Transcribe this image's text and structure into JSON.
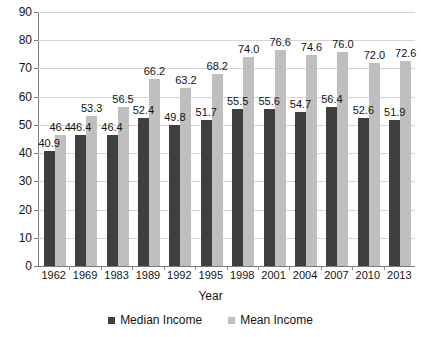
{
  "chart_data": {
    "type": "bar",
    "title": "",
    "subtitle": "",
    "xlabel": "Year",
    "ylabel": "",
    "ylim": [
      0,
      90
    ],
    "yticks": [
      0,
      10,
      20,
      30,
      40,
      50,
      60,
      70,
      80,
      90
    ],
    "grid": true,
    "legend_position": "bottom",
    "categories": [
      "1962",
      "1969",
      "1983",
      "1989",
      "1992",
      "1995",
      "1998",
      "2001",
      "2004",
      "2007",
      "2010",
      "2013"
    ],
    "series": [
      {
        "name": "Median Income",
        "color": "#3f3f3f",
        "values": [
          40.9,
          46.4,
          46.4,
          52.4,
          49.8,
          51.7,
          55.5,
          55.6,
          54.7,
          56.4,
          52.6,
          51.9
        ]
      },
      {
        "name": "Mean Income",
        "color": "#bfbfbf",
        "values": [
          46.4,
          53.3,
          56.5,
          66.2,
          63.2,
          68.2,
          74.0,
          76.6,
          74.6,
          76.0,
          72.0,
          72.6
        ]
      }
    ],
    "data_labels": {
      "median": [
        "40.9",
        "46.4",
        "46.4",
        "52.4",
        "49.8",
        "51.7",
        "55.5",
        "55.6",
        "54.7",
        "56.4",
        "52.6",
        "51.9"
      ],
      "mean": [
        "46.4",
        "53.3",
        "56.5",
        "66.2",
        "63.2",
        "68.2",
        "74.0",
        "76.6",
        "74.6",
        "76.0",
        "72.0",
        "72.6"
      ]
    }
  },
  "axis": {
    "y_tick_labels": [
      "90",
      "80",
      "70",
      "60",
      "50",
      "40",
      "30",
      "20",
      "10",
      "0"
    ],
    "x_title": "Year"
  },
  "legend": {
    "items": [
      {
        "label": "Median Income"
      },
      {
        "label": "Mean Income"
      }
    ]
  }
}
